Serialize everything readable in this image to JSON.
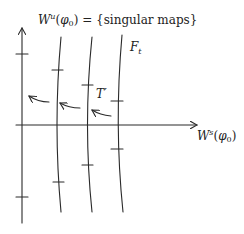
{
  "labels": {
    "unstable_manifold": {
      "symbol": "W",
      "sup": "u",
      "arg_open": "(",
      "arg": "φ",
      "arg_sub": "0",
      "arg_close": ")",
      "rest": " = {singular maps}"
    },
    "stable_manifold": {
      "symbol": "W",
      "sup": "s",
      "arg_open": "(",
      "arg": "φ",
      "arg_sub": "0",
      "arg_close": ")"
    },
    "foliation": {
      "symbol": "F",
      "sub": "t"
    },
    "map": {
      "text": "T′"
    }
  },
  "colors": {
    "ink": "#2a2a2a",
    "background": "#ffffff"
  }
}
